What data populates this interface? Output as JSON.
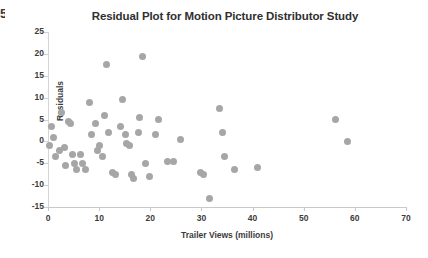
{
  "edge_artifact": {
    "text": "5"
  },
  "chart_data": {
    "type": "scatter",
    "title": "Residual Plot for Motion Picture Distributor Study",
    "xlabel": "Trailer Views (millions)",
    "ylabel": "Residuals",
    "xlim": [
      0,
      70
    ],
    "ylim": [
      -15,
      25
    ],
    "xticks": [
      0,
      10,
      20,
      30,
      40,
      50,
      60,
      70
    ],
    "yticks": [
      25,
      20,
      15,
      10,
      5,
      0,
      -5,
      -10,
      -15
    ],
    "grid": false,
    "legend": null,
    "marker_color": "#a6a6a6",
    "marker_size": 7,
    "points": [
      [
        0.3,
        -1.0
      ],
      [
        0.6,
        3.5
      ],
      [
        1.1,
        1.0
      ],
      [
        1.5,
        -3.5
      ],
      [
        2.2,
        -2.0
      ],
      [
        2.6,
        6.5
      ],
      [
        3.2,
        -1.5
      ],
      [
        3.5,
        -5.5
      ],
      [
        4.1,
        4.5
      ],
      [
        4.4,
        4.0
      ],
      [
        4.8,
        -3.0
      ],
      [
        5.2,
        -5.0
      ],
      [
        5.6,
        -6.5
      ],
      [
        6.3,
        -3.0
      ],
      [
        6.8,
        -5.0
      ],
      [
        7.4,
        -6.5
      ],
      [
        8.1,
        9.0
      ],
      [
        8.6,
        1.5
      ],
      [
        9.2,
        4.0
      ],
      [
        9.6,
        -2.0
      ],
      [
        10.1,
        -1.0
      ],
      [
        10.6,
        -3.5
      ],
      [
        11.1,
        6.0
      ],
      [
        11.4,
        17.5
      ],
      [
        11.9,
        2.0
      ],
      [
        12.6,
        -7.0
      ],
      [
        13.2,
        -7.5
      ],
      [
        14.2,
        3.5
      ],
      [
        14.6,
        9.5
      ],
      [
        15.1,
        1.5
      ],
      [
        15.4,
        -0.5
      ],
      [
        16.0,
        -1.0
      ],
      [
        16.3,
        -7.5
      ],
      [
        16.8,
        -8.5
      ],
      [
        17.6,
        2.0
      ],
      [
        17.9,
        5.5
      ],
      [
        18.4,
        19.5
      ],
      [
        19.1,
        -5.0
      ],
      [
        19.8,
        -8.0
      ],
      [
        21.0,
        1.5
      ],
      [
        21.6,
        5.0
      ],
      [
        23.4,
        -4.5
      ],
      [
        24.6,
        -4.5
      ],
      [
        26.0,
        0.5
      ],
      [
        29.8,
        -7.0
      ],
      [
        30.5,
        -7.5
      ],
      [
        31.5,
        -13.0
      ],
      [
        33.6,
        7.5
      ],
      [
        34.2,
        2.0
      ],
      [
        34.6,
        -3.5
      ],
      [
        36.4,
        -6.5
      ],
      [
        41.0,
        -6.0
      ],
      [
        56.2,
        5.0
      ],
      [
        58.5,
        0.0
      ]
    ]
  }
}
